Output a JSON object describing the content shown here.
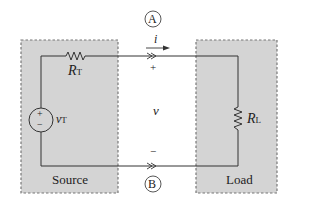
{
  "diagram": {
    "type": "circuit",
    "colors": {
      "box_fill": "#d4d4d4",
      "box_border": "#777777",
      "wire": "#333333",
      "text": "#222222"
    },
    "source_block": {
      "label": "Source",
      "resistor": {
        "symbol": "R",
        "subscript": "T"
      },
      "voltage_source": {
        "symbol": "v",
        "subscript": "T",
        "plus": "+",
        "minus": "−"
      }
    },
    "load_block": {
      "label": "Load",
      "resistor": {
        "symbol": "R",
        "subscript": "L"
      }
    },
    "terminals": {
      "top": {
        "label": "A",
        "polarity": "+"
      },
      "bottom": {
        "label": "B",
        "polarity": "−"
      }
    },
    "current": {
      "symbol": "i"
    },
    "voltage": {
      "symbol": "v"
    }
  }
}
